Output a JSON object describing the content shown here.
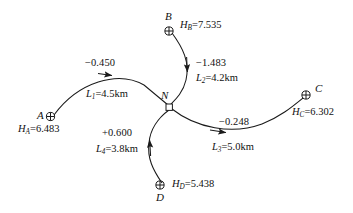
{
  "figure": {
    "type": "leveling-network-diagram",
    "background": "#ffffff",
    "line_color": "#1a1a1a"
  },
  "benchmarks": [
    {
      "id": "A",
      "name": "A",
      "height_label": "H",
      "height_sub": "A",
      "height_text": "=6.483",
      "height_value": 6.483,
      "symbol": "circle-cross"
    },
    {
      "id": "B",
      "name": "B",
      "height_label": "H",
      "height_sub": "B",
      "height_text": "=7.535",
      "height_value": 7.535,
      "symbol": "circle-cross"
    },
    {
      "id": "C",
      "name": "C",
      "height_label": "H",
      "height_sub": "C",
      "height_text": "=6.302",
      "height_value": 6.302,
      "symbol": "circle-cross"
    },
    {
      "id": "D",
      "name": "D",
      "height_label": "H",
      "height_sub": "D",
      "height_text": "=5.438",
      "height_value": 5.438,
      "symbol": "circle-cross"
    }
  ],
  "junction": {
    "name": "N",
    "symbol": "open-square"
  },
  "routes": [
    {
      "id": "L1",
      "from": "A",
      "to": "N",
      "height_diff": "−0.450",
      "height_diff_value": -0.45,
      "length_label": "L",
      "length_sub": "1",
      "length_text": "=4.5km",
      "length_km": 4.5,
      "arrow_direction": "right"
    },
    {
      "id": "L2",
      "from": "B",
      "to": "N",
      "height_diff": "−1.483",
      "height_diff_value": -1.483,
      "length_label": "L",
      "length_sub": "2",
      "length_text": "=4.2km",
      "length_km": 4.2,
      "arrow_direction": "down"
    },
    {
      "id": "L3",
      "from": "N",
      "to": "C",
      "height_diff": "−0.248",
      "height_diff_value": -0.248,
      "length_label": "L",
      "length_sub": "3",
      "length_text": "=5.0km",
      "length_km": 5.0,
      "arrow_direction": "right"
    },
    {
      "id": "L4",
      "from": "D",
      "to": "N",
      "height_diff": "+0.600",
      "height_diff_value": 0.6,
      "length_label": "L",
      "length_sub": "4",
      "length_text": "=3.8km",
      "length_km": 3.8,
      "arrow_direction": "up"
    }
  ]
}
